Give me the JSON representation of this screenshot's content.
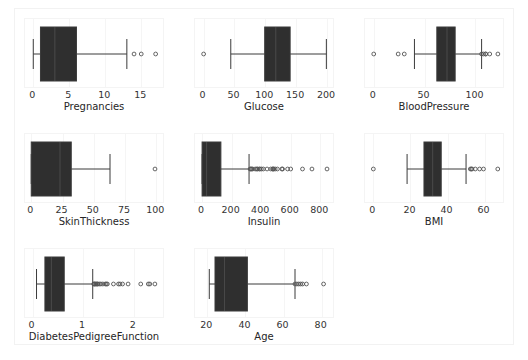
{
  "figure": {
    "width": 528,
    "height": 360,
    "background": "#ffffff",
    "frame_color": "#f2f2f2",
    "box_facecolor": "#2f2f2f",
    "line_color": "#3b3b3b",
    "flier_edgecolor": "#555555",
    "text_color": "#333333",
    "grid_color": "#f5f5f5",
    "layout": "3 x 3 grid of horizontal boxplots (8 panels, last cell empty)"
  },
  "chart_data": {
    "type": "box",
    "orientation": "horizontal",
    "title": "",
    "panels": [
      {
        "name": "pregnancies-panel",
        "xlabel": "Pregnancies",
        "ylabel": "",
        "xlim": [
          -1.15,
          18.3
        ],
        "ticks": [
          0,
          5,
          10,
          15
        ],
        "tick_labels": [
          "0",
          "5",
          "10",
          "15"
        ],
        "stats": {
          "whisker_low": 0,
          "q1": 1,
          "median": 3,
          "q3": 6,
          "whisker_high": 13
        },
        "outliers": [
          14,
          15,
          17
        ]
      },
      {
        "name": "glucose-panel",
        "xlabel": "Glucose",
        "ylabel": "",
        "xlim": [
          -14,
          213
        ],
        "ticks": [
          0,
          50,
          100,
          150,
          200
        ],
        "tick_labels": [
          "0",
          "50",
          "100",
          "150",
          "200"
        ],
        "stats": {
          "whisker_low": 44,
          "q1": 99,
          "median": 117,
          "q3": 140.25,
          "whisker_high": 199
        },
        "outliers": [
          0
        ]
      },
      {
        "name": "bloodpressure-panel",
        "xlabel": "BloodPressure",
        "ylabel": "",
        "xlim": [
          -8.6,
          129
        ],
        "ticks": [
          0,
          50,
          100
        ],
        "tick_labels": [
          "0",
          "50",
          "100"
        ],
        "stats": {
          "whisker_low": 40,
          "q1": 62,
          "median": 72,
          "q3": 80,
          "whisker_high": 106
        },
        "outliers": [
          0,
          24,
          30,
          106,
          108,
          110,
          110,
          114,
          122
        ]
      },
      {
        "name": "skinthickness-panel",
        "xlabel": "SkinThickness",
        "ylabel": "",
        "xlim": [
          -5.0,
          107
        ],
        "ticks": [
          0,
          25,
          50,
          75,
          100
        ],
        "tick_labels": [
          "0",
          "25",
          "50",
          "75",
          "100"
        ],
        "stats": {
          "whisker_low": 0,
          "q1": 0,
          "median": 23,
          "q3": 32,
          "whisker_high": 63
        },
        "outliers": [
          99
        ]
      },
      {
        "name": "insulin-panel",
        "xlabel": "Insulin",
        "ylabel": "",
        "xlim": [
          -48,
          900
        ],
        "ticks": [
          0,
          200,
          400,
          600,
          800
        ],
        "tick_labels": [
          "0",
          "200",
          "400",
          "600",
          "800"
        ],
        "stats": {
          "whisker_low": 0,
          "q1": 0,
          "median": 30.5,
          "q3": 127.25,
          "whisker_high": 318
        },
        "outliers": [
          325,
          330,
          335,
          342,
          360,
          370,
          375,
          387,
          392,
          402,
          415,
          440,
          465,
          478,
          480,
          485,
          495,
          510,
          540,
          545,
          579,
          600,
          680,
          744,
          846
        ]
      },
      {
        "name": "bmi-panel",
        "xlabel": "BMI",
        "ylabel": "",
        "xlim": [
          -4.5,
          71
        ],
        "ticks": [
          0,
          20,
          40,
          60
        ],
        "tick_labels": [
          "0",
          "20",
          "40",
          "60"
        ],
        "stats": {
          "whisker_low": 18.2,
          "q1": 27.3,
          "median": 32.0,
          "q3": 36.6,
          "whisker_high": 50.0
        },
        "outliers": [
          0,
          52.3,
          52.9,
          53.2,
          55.0,
          57.3,
          59.4,
          67.1
        ]
      },
      {
        "name": "diabetespedigreefunction-panel",
        "xlabel": "DiabetesPedigreeFunction",
        "ylabel": "",
        "xlim": [
          -0.15,
          2.62
        ],
        "ticks": [
          0,
          1,
          2
        ],
        "tick_labels": [
          "0",
          "1",
          "2"
        ],
        "stats": {
          "whisker_low": 0.078,
          "q1": 0.244,
          "median": 0.372,
          "q3": 0.626,
          "whisker_high": 1.19
        },
        "outliers": [
          1.21,
          1.22,
          1.23,
          1.25,
          1.26,
          1.28,
          1.29,
          1.32,
          1.35,
          1.39,
          1.44,
          1.46,
          1.48,
          1.6,
          1.7,
          1.73,
          1.78,
          1.89,
          2.14,
          2.29,
          2.32,
          2.42
        ]
      },
      {
        "name": "age-panel",
        "xlabel": "Age",
        "ylabel": "",
        "xlim": [
          13.5,
          87
        ],
        "ticks": [
          20,
          40,
          60,
          80
        ],
        "tick_labels": [
          "20",
          "40",
          "60",
          "80"
        ],
        "stats": {
          "whisker_low": 21,
          "q1": 24,
          "median": 29,
          "q3": 41,
          "whisker_high": 66
        },
        "outliers": [
          66,
          67,
          68,
          69,
          70,
          72,
          81
        ]
      }
    ]
  }
}
